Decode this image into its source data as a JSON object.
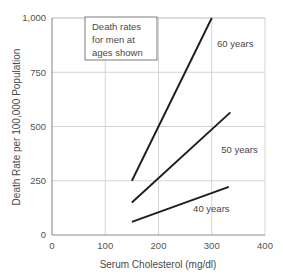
{
  "chart_data": {
    "type": "line",
    "title": "",
    "xlabel": "Serum Cholesterol (mg/dl)",
    "ylabel": "Death Rate per 100,000 Population",
    "xlim": [
      0,
      400
    ],
    "ylim": [
      0,
      1000
    ],
    "xticks": [
      0,
      100,
      200,
      300,
      400
    ],
    "xtick_labels": [
      "0",
      "100",
      "200",
      "300",
      "400"
    ],
    "yticks": [
      0,
      250,
      500,
      750,
      1000
    ],
    "ytick_labels": [
      "0",
      "250",
      "500",
      "750",
      "1,000"
    ],
    "grid": true,
    "legend_position": "inline-labels",
    "annotation": {
      "line1": "Death rates",
      "line2": "for men at",
      "line3": "ages shown"
    },
    "series": [
      {
        "name": "60 years",
        "label": "60 years",
        "x": [
          150,
          300
        ],
        "y": [
          250,
          1000
        ],
        "label_x": 310,
        "label_y": 880
      },
      {
        "name": "50 years",
        "label": "50 years",
        "x": [
          150,
          335
        ],
        "y": [
          150,
          565
        ],
        "label_x": 318,
        "label_y": 395
      },
      {
        "name": "40 years",
        "label": "40 years",
        "x": [
          150,
          332
        ],
        "y": [
          60,
          222
        ],
        "label_x": 265,
        "label_y": 120
      }
    ]
  },
  "axis_titles": {
    "x": "Serum Cholesterol (mg/dl)",
    "y": "Death Rate per 100,000 Population"
  }
}
